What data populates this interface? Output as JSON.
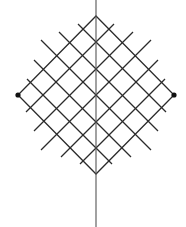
{
  "diagram": {
    "width": 186,
    "height": 227,
    "colors": {
      "line": "#2b2b2b",
      "axis": "#555555",
      "dot": "#111111",
      "background": "#ffffff"
    },
    "axis": {
      "x": 96,
      "y_start": 0,
      "y_end": 227
    },
    "diamond": {
      "top": [
        96,
        16
      ],
      "right": [
        174,
        95
      ],
      "bottom": [
        96,
        174
      ],
      "left": [
        18,
        95
      ]
    },
    "vertex_dots": [
      {
        "name": "left-vertex-dot",
        "cx": 18,
        "cy": 95,
        "r": 2.6
      },
      {
        "name": "right-vertex-dot",
        "cx": 174,
        "cy": 95,
        "r": 2.6
      }
    ],
    "interior_lines": {
      "center_intercepts_y": [
        42,
        69,
        95,
        122,
        148
      ],
      "backslash_lines": [
        {
          "intercept": 42,
          "from": [
            78,
            24
          ],
          "to": [
            166,
            112
          ]
        },
        {
          "intercept": 69,
          "from": [
            59,
            32
          ],
          "to": [
            158,
            131
          ]
        },
        {
          "intercept": 95,
          "from": [
            41,
            40
          ],
          "to": [
            151,
            150
          ]
        },
        {
          "intercept": 122,
          "from": [
            34,
            60
          ],
          "to": [
            131,
            157
          ]
        },
        {
          "intercept": 148,
          "from": [
            27,
            79
          ],
          "to": [
            112,
            164
          ]
        }
      ],
      "slash_lines": [
        {
          "intercept": 42,
          "from": [
            114,
            24
          ],
          "to": [
            26,
            112
          ]
        },
        {
          "intercept": 69,
          "from": [
            133,
            32
          ],
          "to": [
            34,
            131
          ]
        },
        {
          "intercept": 95,
          "from": [
            151,
            40
          ],
          "to": [
            41,
            150
          ]
        },
        {
          "intercept": 122,
          "from": [
            158,
            60
          ],
          "to": [
            61,
            157
          ]
        },
        {
          "intercept": 148,
          "from": [
            165,
            79
          ],
          "to": [
            80,
            164
          ]
        }
      ]
    }
  }
}
